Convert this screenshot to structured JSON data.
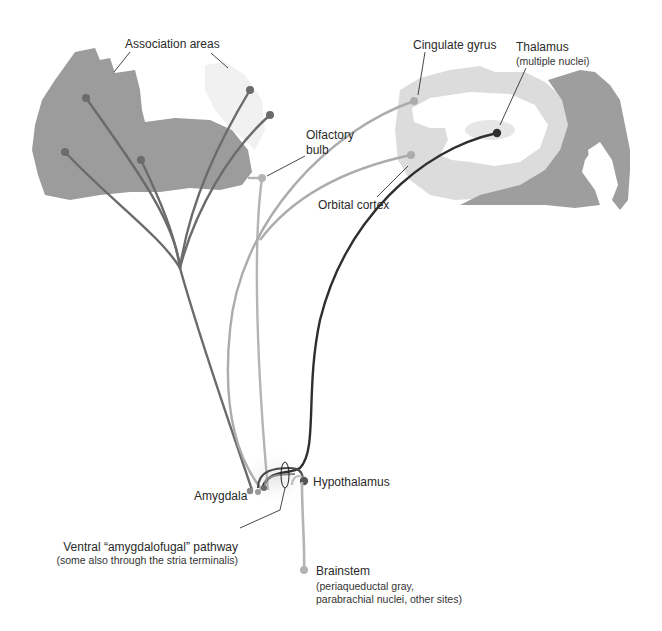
{
  "diagram": {
    "type": "anatomical pathway diagram",
    "colors": {
      "association_region": "#999999",
      "limbic_light_region": "#d9d9d9",
      "brainstem_region": "#9a9a9a",
      "cortical_paths": "#6e6e6e",
      "olfactory_path": "#b0b0b0",
      "cingulate_orbital_paths": "#a8a8a8",
      "thalamus_path": "#2e2e2e",
      "leader_lines": "#333333"
    },
    "labels": {
      "association_areas": "Association areas",
      "cingulate_gyrus": "Cingulate gyrus",
      "thalamus": "Thalamus",
      "thalamus_sub": "(multiple nuclei)",
      "olfactory_bulb_line1": "Olfactory",
      "olfactory_bulb_line2": "bulb",
      "orbital_cortex": "Orbital cortex",
      "hypothalamus": "Hypothalamus",
      "amygdala": "Amygdala",
      "ventral_pathway": "Ventral “amygdalofugal” pathway",
      "ventral_pathway_sub": "(some also through the stria terminalis)",
      "brainstem": "Brainstem",
      "brainstem_sub_line1": "(periaqueductal gray,",
      "brainstem_sub_line2": "parabrachial nuclei, other sites)"
    },
    "nodes": [
      {
        "name": "Association areas",
        "count": 6
      },
      {
        "name": "Olfactory bulb"
      },
      {
        "name": "Cingulate gyrus"
      },
      {
        "name": "Orbital cortex"
      },
      {
        "name": "Thalamus"
      },
      {
        "name": "Amygdala"
      },
      {
        "name": "Hypothalamus"
      },
      {
        "name": "Brainstem"
      }
    ]
  }
}
